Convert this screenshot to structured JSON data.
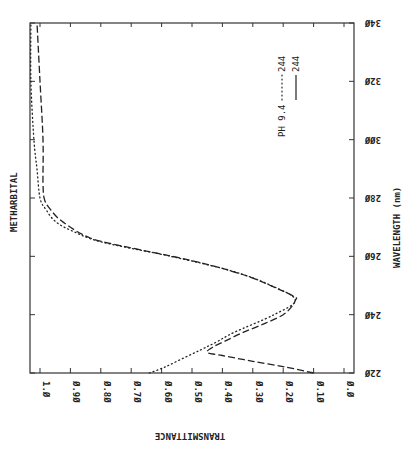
{
  "chart_data": {
    "type": "line",
    "title": "METHARBITAL",
    "orientation": "rotated 90deg clockwise (wavelength axis vertical on right, transmittance axis horizontal at bottom, reversed)",
    "xlabel": "WAVELENGTH (nm)",
    "ylabel": "TRANSMITTANCE",
    "xlim": [
      220,
      340
    ],
    "ylim": [
      0.0,
      1.0
    ],
    "x_ticks": [
      "220",
      "240",
      "260",
      "280",
      "300",
      "320",
      "340"
    ],
    "y_ticks": [
      "1.0",
      "0.90",
      "0.80",
      "0.70",
      "0.60",
      "0.50",
      "0.40",
      "0.30",
      "0.20",
      "0.10",
      "0.0"
    ],
    "grid": false,
    "legend_position": "upper-center (rotated)",
    "legend": [
      {
        "label": "PH 9.4",
        "style": "dotted",
        "value": "244"
      },
      {
        "label": "",
        "style": "dashed",
        "value": "244"
      }
    ],
    "series": [
      {
        "name": "PH 9.4 (dotted)",
        "style": "dotted",
        "x": [
          220,
          222,
          225,
          228,
          230.6,
          234,
          240,
          245,
          250,
          255,
          260,
          265,
          269,
          272,
          276,
          280,
          290,
          300,
          320,
          340
        ],
        "y": [
          0.64,
          0.59,
          0.53,
          0.47,
          0.42,
          0.36,
          0.23,
          0.16,
          0.24,
          0.37,
          0.57,
          0.8,
          0.9,
          0.95,
          0.98,
          1.0,
          1.01,
          1.02,
          1.03,
          1.03
        ]
      },
      {
        "name": "244 (dashed)",
        "style": "dashed",
        "x": [
          220,
          222,
          224,
          226,
          227,
          229,
          231,
          234,
          237,
          240,
          243,
          245,
          246,
          248.5,
          252.9,
          257,
          260.1,
          262.9,
          266.3,
          271.8,
          276,
          279.4,
          285,
          300,
          320,
          340
        ],
        "y": [
          0.1,
          0.19,
          0.3,
          0.4,
          0.45,
          0.43,
          0.39,
          0.33,
          0.26,
          0.2,
          0.17,
          0.16,
          0.16,
          0.21,
          0.31,
          0.44,
          0.57,
          0.7,
          0.835,
          0.925,
          0.965,
          0.985,
          0.99,
          0.99,
          1.0,
          1.01
        ]
      }
    ]
  },
  "labels": {
    "compound": "METHARBITAL",
    "wavelength_axis": "WAVELENGTH (nm)",
    "transmittance_axis": "TRANSMITTANCE",
    "legend_ph": "PH 9.4",
    "legend_dotted_value": "244",
    "legend_dashed_value": "244"
  }
}
